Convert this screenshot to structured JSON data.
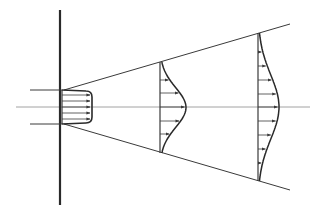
{
  "diagram": {
    "type": "free-jet-velocity-profiles",
    "colors": {
      "background": "#ffffff",
      "stroke": "#3a3a3a",
      "wall": "#2a2a2a",
      "centerline": "#8a8a8a"
    },
    "wall": {
      "x": 60,
      "y1": 10,
      "y2": 205
    },
    "centerline": {
      "y": 107,
      "x1": 16,
      "x2": 310
    },
    "inlet": {
      "y_top": 90,
      "y_bottom": 124,
      "x1": 30,
      "x2": 62
    },
    "nozzle_profile": {
      "x0": 62,
      "x_peak": 92,
      "y_top": 90,
      "y_bottom": 124,
      "arrows_y": [
        95,
        101,
        107,
        113,
        119
      ]
    },
    "spread_lines": {
      "upper": {
        "x1": 64,
        "y1": 90,
        "x2": 290,
        "y2": 24
      },
      "lower": {
        "x1": 64,
        "y1": 124,
        "x2": 290,
        "y2": 190
      }
    },
    "profiles": [
      {
        "x0": 160,
        "y_top": 62,
        "y_bottom": 153,
        "peak_x": 186,
        "arrows_y": [
          70,
          80,
          93,
          107,
          121,
          134,
          145
        ]
      },
      {
        "x0": 258,
        "y_top": 33,
        "y_bottom": 181,
        "peak_x": 279,
        "arrows_y": [
          52,
          66,
          80,
          94,
          107,
          121,
          135,
          149,
          163
        ]
      }
    ]
  }
}
